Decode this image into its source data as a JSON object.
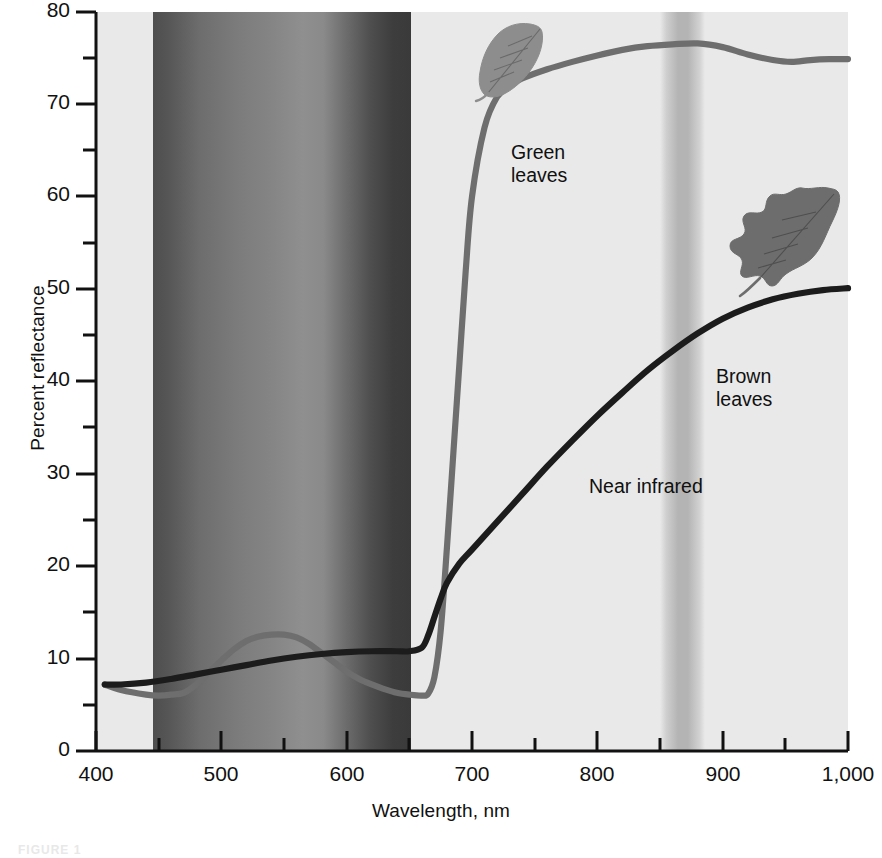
{
  "figure": {
    "caption": "FIGURE 1",
    "background": "#ffffff",
    "plot_background": "#e9e9e9"
  },
  "annotations": {
    "green_leaves": "Green\nleaves",
    "brown_leaves": "Brown\nleaves",
    "near_infrared": "Near infrared",
    "green_leaf_icon": "leaf-icon-green",
    "brown_leaf_icon": "leaf-icon-brown"
  },
  "colors": {
    "green_curve": "#6e6e6e",
    "brown_curve": "#1c1c1c",
    "axis": "#111111",
    "visible_band_violet": "#4a4a4a",
    "visible_band_green": "#8e8e8e",
    "visible_band_red": "#3a3a3a",
    "nir_band": "#b8b8b8",
    "plot_bg": "#e9e9e9"
  },
  "chart_data": {
    "type": "line",
    "title": "",
    "xlabel": "Wavelength, nm",
    "ylabel": "Percent reflectance",
    "xlim": [
      400,
      1000
    ],
    "ylim": [
      0,
      80
    ],
    "grid": false,
    "legend_position": "inline-annotations",
    "xticks": [
      400,
      500,
      600,
      700,
      800,
      900,
      1000
    ],
    "xticklabels": [
      "400",
      "500",
      "600",
      "700",
      "800",
      "900",
      "1,000"
    ],
    "xminor_step": 50,
    "yticks": [
      0,
      10,
      20,
      30,
      40,
      50,
      60,
      70,
      80
    ],
    "yticklabels": [
      "0",
      "10",
      "20",
      "30",
      "40",
      "50",
      "60",
      "70",
      "80"
    ],
    "yminor_step": 5,
    "bands": [
      {
        "name": "Visible spectrum",
        "x0": 450,
        "x1": 650,
        "label": ""
      },
      {
        "name": "Near infrared",
        "x0": 850,
        "x1": 880,
        "label": "Near infrared"
      }
    ],
    "series": [
      {
        "name": "Green leaves",
        "color": "#6e6e6e",
        "x": [
          407,
          420,
          440,
          450,
          460,
          470,
          480,
          490,
          500,
          510,
          520,
          530,
          540,
          550,
          560,
          570,
          580,
          590,
          600,
          610,
          620,
          630,
          640,
          650,
          660,
          665,
          670,
          675,
          680,
          685,
          690,
          695,
          700,
          710,
          720,
          730,
          740,
          760,
          780,
          800,
          820,
          840,
          860,
          880,
          900,
          920,
          940,
          955,
          970,
          985,
          1000
        ],
        "y": [
          7.2,
          6.6,
          6.1,
          6.0,
          6.1,
          6.3,
          7.2,
          8.5,
          9.8,
          11.0,
          11.9,
          12.4,
          12.6,
          12.6,
          12.3,
          11.6,
          10.6,
          9.6,
          8.6,
          7.8,
          7.2,
          6.7,
          6.3,
          6.1,
          6.0,
          6.2,
          8.0,
          13.0,
          22.0,
          32.0,
          42.0,
          52.0,
          60.0,
          67.5,
          70.8,
          72.0,
          72.8,
          73.8,
          74.6,
          75.3,
          75.9,
          76.3,
          76.5,
          76.6,
          76.2,
          75.4,
          74.8,
          74.6,
          74.8,
          74.9,
          74.9
        ]
      },
      {
        "name": "Brown leaves",
        "color": "#1c1c1c",
        "x": [
          407,
          420,
          440,
          460,
          480,
          500,
          520,
          540,
          560,
          580,
          600,
          620,
          640,
          650,
          660,
          665,
          670,
          675,
          680,
          690,
          700,
          720,
          740,
          760,
          780,
          800,
          820,
          840,
          860,
          880,
          900,
          920,
          940,
          960,
          980,
          1000
        ],
        "y": [
          7.2,
          7.2,
          7.4,
          7.8,
          8.3,
          8.8,
          9.3,
          9.8,
          10.2,
          10.5,
          10.7,
          10.8,
          10.8,
          10.8,
          11.2,
          12.5,
          14.5,
          16.5,
          18.2,
          20.3,
          21.8,
          24.8,
          27.8,
          30.8,
          33.6,
          36.3,
          38.8,
          41.2,
          43.3,
          45.2,
          46.8,
          48.0,
          48.9,
          49.5,
          49.9,
          50.1
        ]
      }
    ]
  }
}
